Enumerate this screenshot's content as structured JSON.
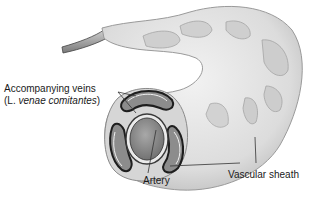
{
  "figure": {
    "labels": {
      "veins_line1": "Accompanying veins",
      "veins_line2_prefix": "(L. ",
      "veins_line2_italic": "venae comitantes",
      "veins_line2_suffix": ")",
      "artery": "Artery",
      "sheath": "Vascular sheath"
    },
    "colors": {
      "sheath_fill": "#e6e6e6",
      "sheath_shadow": "#bdbdbd",
      "vein_wall": "#2a2a2a",
      "artery_lumen": "#8a8a8a",
      "background": "#ffffff"
    }
  }
}
